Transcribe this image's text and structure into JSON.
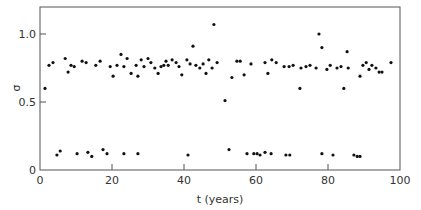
{
  "chart_data": {
    "type": "scatter",
    "title": "",
    "xlabel": "t (years)",
    "ylabel": "σ",
    "xlim": [
      0,
      100
    ],
    "ylim": [
      0,
      1.2
    ],
    "xticks": [
      0,
      20,
      40,
      60,
      80,
      100
    ],
    "xtick_labels": [
      "0",
      "20",
      "40",
      "60",
      "80",
      "100"
    ],
    "yticks": [
      0,
      0.5,
      1.0
    ],
    "ytick_labels": [
      "0",
      "0.5",
      "1.0"
    ],
    "grid": false,
    "legend": null,
    "marker_color": "#111111",
    "axis_color": "#555555",
    "series": [
      {
        "name": "upper cluster",
        "points": [
          [
            1.4,
            0.6
          ],
          [
            2.5,
            0.77
          ],
          [
            3.6,
            0.79
          ],
          [
            7.0,
            0.82
          ],
          [
            7.8,
            0.72
          ],
          [
            8.6,
            0.77
          ],
          [
            9.5,
            0.76
          ],
          [
            11.7,
            0.8
          ],
          [
            12.8,
            0.79
          ],
          [
            15.5,
            0.77
          ],
          [
            16.7,
            0.8
          ],
          [
            19.5,
            0.76
          ],
          [
            20.3,
            0.69
          ],
          [
            21.4,
            0.77
          ],
          [
            22.5,
            0.85
          ],
          [
            23.3,
            0.76
          ],
          [
            24.2,
            0.82
          ],
          [
            25.3,
            0.71
          ],
          [
            26.7,
            0.77
          ],
          [
            27.2,
            0.69
          ],
          [
            28.1,
            0.81
          ],
          [
            28.9,
            0.76
          ],
          [
            30.0,
            0.82
          ],
          [
            30.8,
            0.79
          ],
          [
            31.9,
            0.75
          ],
          [
            32.8,
            0.71
          ],
          [
            33.6,
            0.76
          ],
          [
            34.4,
            0.77
          ],
          [
            35.0,
            0.8
          ],
          [
            35.6,
            0.77
          ],
          [
            36.7,
            0.81
          ],
          [
            37.8,
            0.79
          ],
          [
            38.6,
            0.76
          ],
          [
            39.4,
            0.7
          ],
          [
            40.8,
            0.81
          ],
          [
            41.7,
            0.78
          ],
          [
            42.5,
            0.91
          ],
          [
            43.3,
            0.77
          ],
          [
            44.4,
            0.75
          ],
          [
            45.3,
            0.78
          ],
          [
            46.1,
            0.71
          ],
          [
            46.9,
            0.81
          ],
          [
            47.8,
            0.75
          ],
          [
            48.3,
            1.07
          ],
          [
            49.2,
            0.79
          ],
          [
            51.4,
            0.51
          ],
          [
            53.3,
            0.68
          ],
          [
            54.7,
            0.8
          ],
          [
            55.6,
            0.8
          ],
          [
            56.7,
            0.7
          ],
          [
            58.6,
            0.78
          ],
          [
            62.5,
            0.79
          ],
          [
            63.3,
            0.71
          ],
          [
            64.4,
            0.81
          ],
          [
            65.6,
            0.79
          ],
          [
            67.8,
            0.76
          ],
          [
            69.2,
            0.76
          ],
          [
            70.3,
            0.77
          ],
          [
            72.2,
            0.6
          ],
          [
            72.5,
            0.75
          ],
          [
            73.9,
            0.76
          ],
          [
            75.0,
            0.77
          ],
          [
            76.7,
            0.75
          ],
          [
            77.5,
            1.0
          ],
          [
            78.3,
            0.9
          ],
          [
            79.7,
            0.74
          ],
          [
            80.6,
            0.77
          ],
          [
            82.5,
            0.75
          ],
          [
            83.6,
            0.76
          ],
          [
            84.4,
            0.6
          ],
          [
            85.3,
            0.87
          ],
          [
            85.6,
            0.75
          ],
          [
            88.9,
            0.69
          ],
          [
            89.7,
            0.77
          ],
          [
            90.6,
            0.79
          ],
          [
            91.4,
            0.74
          ],
          [
            92.2,
            0.77
          ],
          [
            93.3,
            0.75
          ],
          [
            94.2,
            0.72
          ],
          [
            95.0,
            0.72
          ],
          [
            97.5,
            0.79
          ]
        ]
      },
      {
        "name": "lower cluster",
        "points": [
          [
            4.7,
            0.11
          ],
          [
            5.6,
            0.14
          ],
          [
            10.3,
            0.12
          ],
          [
            13.3,
            0.13
          ],
          [
            14.4,
            0.1
          ],
          [
            17.5,
            0.15
          ],
          [
            18.6,
            0.12
          ],
          [
            23.3,
            0.12
          ],
          [
            27.2,
            0.12
          ],
          [
            41.1,
            0.11
          ],
          [
            52.5,
            0.15
          ],
          [
            57.5,
            0.12
          ],
          [
            59.4,
            0.12
          ],
          [
            60.3,
            0.12
          ],
          [
            61.1,
            0.11
          ],
          [
            62.5,
            0.13
          ],
          [
            64.2,
            0.12
          ],
          [
            68.3,
            0.11
          ],
          [
            69.4,
            0.11
          ],
          [
            78.3,
            0.12
          ],
          [
            81.4,
            0.11
          ],
          [
            87.2,
            0.11
          ],
          [
            88.1,
            0.1
          ],
          [
            88.9,
            0.1
          ]
        ]
      }
    ]
  }
}
